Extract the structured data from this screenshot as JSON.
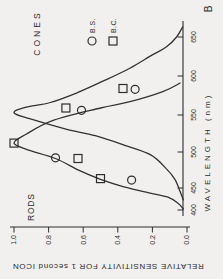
{
  "figure": {
    "panel_label": "B",
    "rods_label": "RODS",
    "cones_label": "CONES",
    "legend": [
      {
        "marker": "circle",
        "label": "B.S."
      },
      {
        "marker": "square",
        "label": "B.C."
      }
    ]
  },
  "chart_data": {
    "type": "line",
    "title": "",
    "xlabel": "WAVELENGTH (nm)",
    "ylabel": "RELATIVE SENSITIVITY FOR 1 second ICON",
    "xlim": [
      400,
      665
    ],
    "ylim": [
      0.0,
      1.0
    ],
    "x_ticks": [
      400,
      450,
      500,
      550,
      600,
      650
    ],
    "y_tick_values": [
      1.0,
      0.8,
      0.6,
      0.4,
      0.2,
      0.0
    ],
    "y_tick_labels": [
      "1.0",
      "0.8",
      "0.6",
      "0.4",
      "0.2",
      "0.0"
    ],
    "grid": false,
    "legend_position": "upper-right",
    "rotation_in_page_deg": -90,
    "series": [
      {
        "name": "RODS curve",
        "kind": "curve",
        "points": [
          [
            402,
            0.02
          ],
          [
            415,
            0.05
          ],
          [
            429,
            0.11
          ],
          [
            439,
            0.22
          ],
          [
            452,
            0.37
          ],
          [
            462,
            0.5
          ],
          [
            474,
            0.62
          ],
          [
            491,
            0.76
          ],
          [
            503,
            0.92
          ],
          [
            512,
            1.0
          ],
          [
            524,
            0.93
          ],
          [
            543,
            0.77
          ],
          [
            559,
            0.5
          ],
          [
            567,
            0.33
          ],
          [
            580,
            0.14
          ],
          [
            591,
            0.04
          ]
        ]
      },
      {
        "name": "CONES curve",
        "kind": "curve",
        "points": [
          [
            423,
            0.02
          ],
          [
            442,
            0.04
          ],
          [
            462,
            0.07
          ],
          [
            477,
            0.12
          ],
          [
            496,
            0.21
          ],
          [
            509,
            0.36
          ],
          [
            522,
            0.53
          ],
          [
            531,
            0.7
          ],
          [
            545,
            0.91
          ],
          [
            553,
            1.0
          ],
          [
            560,
            0.93
          ],
          [
            566,
            0.79
          ],
          [
            579,
            0.63
          ],
          [
            594,
            0.48
          ],
          [
            610,
            0.33
          ],
          [
            627,
            0.2
          ],
          [
            637,
            0.12
          ],
          [
            650,
            0.06
          ],
          [
            663,
            0.025
          ]
        ]
      },
      {
        "name": "B.S.",
        "kind": "scatter",
        "marker": "circle",
        "points": [
          [
            461,
            0.32
          ],
          [
            492,
            0.76
          ],
          [
            556,
            0.61
          ],
          [
            583,
            0.3
          ]
        ]
      },
      {
        "name": "B.C.",
        "kind": "scatter",
        "marker": "square",
        "points": [
          [
            463,
            0.5
          ],
          [
            491,
            0.63
          ],
          [
            512,
            1.0
          ],
          [
            559,
            0.7
          ],
          [
            584,
            0.37
          ]
        ]
      }
    ]
  },
  "colors": {
    "ink": "#2d2d2d",
    "paper": "#f1f0ee"
  }
}
